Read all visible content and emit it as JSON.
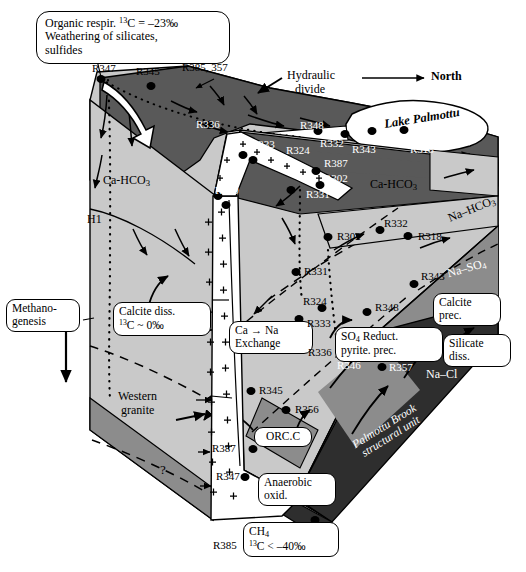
{
  "figure": {
    "type": "hydrogeochemical-block-diagram",
    "site": "Palmottu",
    "north_arrow_label": "North",
    "lake_label": "Lake Palmottu",
    "unit_label_line1": "Palmottu Brook",
    "unit_label_line2": "structural unit",
    "western_granite_line1": "Western",
    "western_granite_line2": "granite",
    "hydraulic_divide_line1": "Hydraulic",
    "hydraulic_divide_line2": "divide",
    "horizon_label": "H1",
    "question_mark": "?"
  },
  "callouts": [
    {
      "id": "organic-respiration",
      "line1_a": "Organic respir. ",
      "line1_sup": "13",
      "line1_b": "C = –23‰",
      "line2": "Weathering of silicates,",
      "line3": "sulfides"
    },
    {
      "id": "methanogenesis",
      "line1": "Methano-",
      "line2": "genesis"
    },
    {
      "id": "calcite-dissolution",
      "line1": "Calcite diss.",
      "line2_sup": "13",
      "line2_b": "C ~ 0‰"
    },
    {
      "id": "ca-na-exchange",
      "line1": "Ca → Na",
      "line2": "Exchange"
    },
    {
      "id": "sulfate-reduction",
      "line1_a": "SO",
      "line1_sub": "4",
      "line1_b": " Reduct.",
      "line2": "pyrite. prec."
    },
    {
      "id": "calcite-precipitation",
      "line1": "Calcite",
      "line2": "prec."
    },
    {
      "id": "silicate-dissolution",
      "line1": "Silicate",
      "line2": "diss."
    },
    {
      "id": "organic-carbon",
      "line1": "ORC.C"
    },
    {
      "id": "anaerobic-oxidation",
      "line1": "Anaerobic",
      "line2": "oxid."
    },
    {
      "id": "methane",
      "line1_a": "CH",
      "line1_sub": "4",
      "line2_sup": "13",
      "line2_b": "C < –40‰"
    }
  ],
  "facies": [
    {
      "id": "ca-hco3-upper",
      "text": "Ca-HCO3",
      "html": "Ca-HCO<sub>3</sub>"
    },
    {
      "id": "ca-hco3-right",
      "text": "Ca-HCO3",
      "html": "Ca-HCO<sub>3</sub>"
    },
    {
      "id": "na-hco3",
      "text": "Na–HCO3",
      "html": "Na–HCO<sub>3</sub>"
    },
    {
      "id": "na-so4",
      "text": "Na–SO4",
      "html": "Na–SO<sub>4</sub>"
    },
    {
      "id": "na-cl",
      "text": "Na–Cl",
      "html": "Na–Cl"
    }
  ],
  "wells": [
    {
      "id": "R347-top",
      "label": "R347"
    },
    {
      "id": "R345-top",
      "label": "R345"
    },
    {
      "id": "R385-357",
      "label": "R385, 357"
    },
    {
      "id": "R336-top",
      "label": "R336"
    },
    {
      "id": "R348-top",
      "label": "R348"
    },
    {
      "id": "R332-top",
      "label": "R332"
    },
    {
      "id": "R324-top",
      "label": "R324"
    },
    {
      "id": "R343-top",
      "label": "R343"
    },
    {
      "id": "R318-top",
      "label": "R318"
    },
    {
      "id": "R333",
      "label": "R333"
    },
    {
      "id": "R387-up",
      "label": "R387"
    },
    {
      "id": "R302-up",
      "label": "R302"
    },
    {
      "id": "R340",
      "label": "R340"
    },
    {
      "id": "R331-up",
      "label": "R331"
    },
    {
      "id": "R302-mid",
      "label": "R302"
    },
    {
      "id": "R332-mid",
      "label": "R332"
    },
    {
      "id": "R318-mid",
      "label": "R318"
    },
    {
      "id": "R331-mid",
      "label": "R331"
    },
    {
      "id": "R343-mid",
      "label": "R343"
    },
    {
      "id": "R324-mid",
      "label": "R324"
    },
    {
      "id": "R333-mid",
      "label": "R333"
    },
    {
      "id": "R348-mid",
      "label": "R348"
    },
    {
      "id": "R336-mid",
      "label": "R336"
    },
    {
      "id": "R346",
      "label": "R346"
    },
    {
      "id": "R357",
      "label": "R357"
    },
    {
      "id": "R345-mid",
      "label": "R345"
    },
    {
      "id": "R356",
      "label": "R356"
    },
    {
      "id": "R387-low",
      "label": "R387"
    },
    {
      "id": "R347-low",
      "label": "R347"
    },
    {
      "id": "R385-low",
      "label": "R385"
    }
  ],
  "colors": {
    "lightest": "#f2f2f2",
    "light_gray": "#c9c9c9",
    "mid_light": "#b3b3b3",
    "mid_gray": "#8c8c8c",
    "dark_gray": "#595959",
    "darkest": "#2e2e2e",
    "outline": "#000000",
    "white": "#ffffff"
  }
}
